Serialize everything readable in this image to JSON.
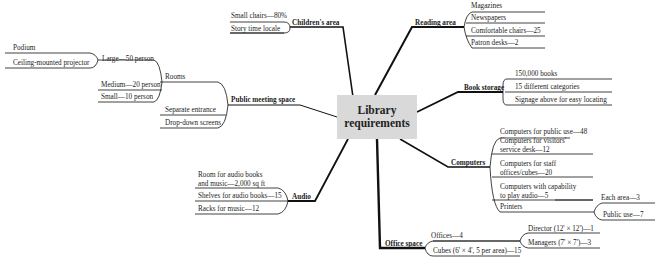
{
  "center": {
    "line1": "Library",
    "line2": "requirements"
  },
  "colors": {
    "line": "#111111",
    "center_bg": "#d9d9d9",
    "text": "#222222"
  },
  "branches": {
    "childrens_area": {
      "label": "Children's area",
      "items": [
        "Small chairs—80%",
        "Story time locale"
      ]
    },
    "reading_area": {
      "label": "Reading area",
      "items": [
        "Magazines",
        "Newspapers",
        "Comfortable chairs—25",
        "Patron desks—2"
      ]
    },
    "public_meeting_space": {
      "label": "Public meeting space",
      "rooms": {
        "label": "Rooms",
        "large": {
          "label": "Large—50 person",
          "items": [
            "Podium",
            "Ceiling-mounted projector"
          ]
        },
        "medium": "Medium—20 person",
        "small": "Small—10 person"
      },
      "items": [
        "Separate entrance",
        "Drop-down screens"
      ]
    },
    "book_storage": {
      "label": "Book storage",
      "items": [
        "150,000 books",
        "15 different categories",
        "Signage above for easy locating"
      ]
    },
    "computers": {
      "label": "Computers",
      "items": [
        {
          "l1": "Computers for public use—48"
        },
        {
          "l1": "Computers for visitors'",
          "l2": "service desk—12"
        },
        {
          "l1": "Computers for staff",
          "l2": "offices/cubes—20"
        },
        {
          "l1": "Computers with capability",
          "l2": "to play audio—5"
        }
      ],
      "printers": {
        "label": "Printers",
        "items": [
          "Each area—3",
          "Public use—7"
        ]
      }
    },
    "audio": {
      "label": "Audio",
      "items": [
        {
          "l1": "Room for audio books",
          "l2": "and music—2,000 sq ft"
        },
        {
          "l1": "Shelves for audio books—15"
        },
        {
          "l1": "Racks for music—12"
        }
      ]
    },
    "office_space": {
      "label": "Office space",
      "offices": {
        "label": "Offices—4",
        "items": [
          "Director (12' × 12')—1",
          "Managers (7' × 7')—3"
        ]
      },
      "cubes": "Cubes (6' × 4', 5 per area)—15"
    }
  }
}
